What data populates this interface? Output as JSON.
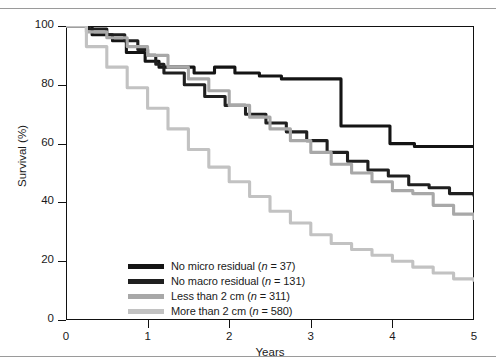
{
  "figure": {
    "y_axis_title": "Survival (%)",
    "x_axis_title": "Years",
    "y_ticks": [
      "0",
      "20",
      "40",
      "60",
      "80",
      "100"
    ],
    "x_ticks": [
      "0",
      "1",
      "2",
      "3",
      "4",
      "5"
    ]
  },
  "legend": {
    "items": [
      {
        "label_main": "No micro residual",
        "n_prefix": "(",
        "n_symbol": "n",
        "n_value": " = 37)",
        "full": "No micro residual (n = 37)",
        "color": "#141414"
      },
      {
        "label_main": "No macro residual",
        "n_prefix": "(",
        "n_symbol": "n",
        "n_value": " = 131)",
        "full": "No macro residual (n = 131)",
        "color": "#1f1f1f"
      },
      {
        "label_main": "Less than 2 cm",
        "n_prefix": "(",
        "n_symbol": "n",
        "n_value": " = 311)",
        "full": "Less than 2 cm (n = 311)",
        "color": "#a8a8a8"
      },
      {
        "label_main": "More than 2 cm",
        "n_prefix": "(",
        "n_symbol": "n",
        "n_value": " = 580)",
        "full": "More than 2 cm (n = 580)",
        "color": "#c2c2c2"
      }
    ]
  },
  "chart_data": {
    "type": "line",
    "title": "",
    "xlabel": "Years",
    "ylabel": "Survival (%)",
    "xlim": [
      0,
      5
    ],
    "ylim": [
      0,
      100
    ],
    "xticks": [
      0,
      1,
      2,
      3,
      4,
      5
    ],
    "yticks": [
      0,
      20,
      40,
      60,
      80,
      100
    ],
    "grid": false,
    "legend_position": "lower-center-inside",
    "style": "kaplan-meier step curves",
    "series": [
      {
        "name": "No micro residual (n = 37)",
        "n": 37,
        "color": "#141414",
        "style": "step",
        "points": [
          [
            0.0,
            100
          ],
          [
            0.3,
            100
          ],
          [
            0.32,
            97
          ],
          [
            0.55,
            97
          ],
          [
            0.57,
            95
          ],
          [
            0.72,
            95
          ],
          [
            0.74,
            91
          ],
          [
            0.95,
            91
          ],
          [
            0.97,
            88
          ],
          [
            1.12,
            88
          ],
          [
            1.14,
            86
          ],
          [
            1.55,
            86
          ],
          [
            1.57,
            84
          ],
          [
            1.8,
            84
          ],
          [
            1.82,
            86
          ],
          [
            2.05,
            86
          ],
          [
            2.07,
            84
          ],
          [
            2.35,
            84
          ],
          [
            2.37,
            83
          ],
          [
            2.62,
            83
          ],
          [
            2.64,
            82
          ],
          [
            2.9,
            82
          ],
          [
            2.92,
            82
          ],
          [
            3.35,
            82
          ],
          [
            3.37,
            66
          ],
          [
            3.95,
            66
          ],
          [
            3.97,
            60
          ],
          [
            4.25,
            60
          ],
          [
            4.27,
            59
          ],
          [
            5.0,
            59
          ]
        ],
        "end_value": 59
      },
      {
        "name": "No macro residual (n = 131)",
        "n": 131,
        "color": "#1f1f1f",
        "style": "step",
        "points": [
          [
            0.0,
            100
          ],
          [
            0.28,
            99
          ],
          [
            0.5,
            97
          ],
          [
            0.72,
            95
          ],
          [
            0.88,
            92
          ],
          [
            1.0,
            90
          ],
          [
            1.1,
            87
          ],
          [
            1.2,
            84
          ],
          [
            1.45,
            80
          ],
          [
            1.7,
            76
          ],
          [
            1.95,
            73
          ],
          [
            2.2,
            70
          ],
          [
            2.45,
            67
          ],
          [
            2.7,
            64
          ],
          [
            2.95,
            61
          ],
          [
            3.2,
            57
          ],
          [
            3.45,
            54
          ],
          [
            3.7,
            51
          ],
          [
            3.95,
            49
          ],
          [
            4.2,
            46
          ],
          [
            4.45,
            45
          ],
          [
            4.7,
            43
          ],
          [
            5.0,
            42
          ]
        ],
        "end_value": 42
      },
      {
        "name": "Less than 2 cm (n = 311)",
        "n": 311,
        "color": "#a8a8a8",
        "style": "step",
        "points": [
          [
            0.0,
            100
          ],
          [
            0.25,
            98
          ],
          [
            0.5,
            96
          ],
          [
            0.75,
            93
          ],
          [
            1.0,
            90
          ],
          [
            1.25,
            86
          ],
          [
            1.5,
            82
          ],
          [
            1.75,
            78
          ],
          [
            2.0,
            73
          ],
          [
            2.25,
            69
          ],
          [
            2.5,
            65
          ],
          [
            2.75,
            61
          ],
          [
            3.0,
            57
          ],
          [
            3.25,
            53
          ],
          [
            3.5,
            50
          ],
          [
            3.75,
            47
          ],
          [
            4.0,
            44
          ],
          [
            4.25,
            43
          ],
          [
            4.5,
            39
          ],
          [
            4.75,
            36
          ],
          [
            5.0,
            34
          ]
        ],
        "end_value": 34
      },
      {
        "name": "More than 2 cm (n = 580)",
        "n": 580,
        "color": "#c2c2c2",
        "style": "step",
        "points": [
          [
            0.0,
            100
          ],
          [
            0.25,
            93
          ],
          [
            0.5,
            86
          ],
          [
            0.75,
            79
          ],
          [
            1.0,
            72
          ],
          [
            1.25,
            65
          ],
          [
            1.5,
            58
          ],
          [
            1.75,
            52
          ],
          [
            2.0,
            47
          ],
          [
            2.25,
            42
          ],
          [
            2.5,
            37
          ],
          [
            2.75,
            33
          ],
          [
            3.0,
            29
          ],
          [
            3.25,
            26
          ],
          [
            3.5,
            24
          ],
          [
            3.75,
            22
          ],
          [
            4.0,
            20
          ],
          [
            4.25,
            18
          ],
          [
            4.5,
            16
          ],
          [
            4.75,
            14
          ],
          [
            5.0,
            13
          ]
        ],
        "end_value": 13
      }
    ]
  }
}
